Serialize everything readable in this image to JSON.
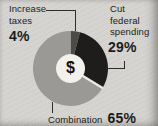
{
  "chart_data": {
    "type": "pie",
    "subtype": "donut",
    "title": "",
    "center_symbol": "$",
    "start_angle_deg": 0,
    "direction": "clockwise",
    "legend_position": "callout-labels",
    "segments": [
      {
        "label": "Increase taxes",
        "value": 4,
        "pct_label": "4%",
        "color": "#4c4b49"
      },
      {
        "label": "Cut federal spending",
        "value": 29,
        "pct_label": "29%",
        "color": "#1e1d1b",
        "gap_after": true
      },
      {
        "label": "Combination",
        "value": 65,
        "pct_label": "65%",
        "color": "#9a9996"
      }
    ],
    "hole_color": "#f2f1ec",
    "gap_color": "#eceae6"
  },
  "labels": {
    "increase": {
      "line1": "Increase",
      "line2": "taxes",
      "pct": "4%"
    },
    "cut": {
      "line1": "Cut",
      "line2": "federal",
      "line3": "spending",
      "pct": "29%"
    },
    "combination": {
      "text": "Combination",
      "pct": "65%"
    }
  },
  "colors": {
    "background": "#d6d5d1",
    "text": "#1b1b1b",
    "leader_line": "#2e2d2b"
  }
}
